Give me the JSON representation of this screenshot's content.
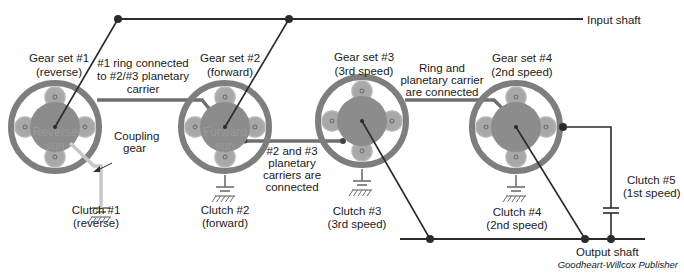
{
  "colors": {
    "ring": "#7e7e7e",
    "ring_inner": "#ffffff",
    "sun": "#8c8c8c",
    "carrier": "#bdbdbd",
    "planet": "#a8a8a8",
    "shaft": "#2b2b2b",
    "shaft_gray": "#6f6f6f",
    "coupling": "#c8c8c8"
  },
  "shafts": {
    "input": "Input shaft",
    "output": "Output shaft"
  },
  "gear_sets": [
    {
      "id": 1,
      "title": "Gear set #1",
      "subtitle": "(reverse)",
      "sun_line1": "Reverse",
      "sun_line2": "sun"
    },
    {
      "id": 2,
      "title": "Gear set #2",
      "subtitle": "(forward)",
      "sun_line1": "Forward",
      "sun_line2": "sun"
    },
    {
      "id": 3,
      "title": "Gear set #3",
      "subtitle": "(3rd speed)",
      "sun_line1": "",
      "sun_line2": ""
    },
    {
      "id": 4,
      "title": "Gear set #4",
      "subtitle": "(2nd speed)",
      "sun_line1": "",
      "sun_line2": ""
    }
  ],
  "clutches": [
    {
      "title": "Clutch #1",
      "subtitle": "(reverse)"
    },
    {
      "title": "Clutch #2",
      "subtitle": "(forward)"
    },
    {
      "title": "Clutch #3",
      "subtitle": "(3rd speed)"
    },
    {
      "title": "Clutch #4",
      "subtitle": "(2nd speed)"
    },
    {
      "title": "Clutch #5",
      "subtitle": "(1st speed)"
    }
  ],
  "annotations": {
    "ring_to_carrier": [
      "#1 ring connected",
      "to #2/#3 planetary",
      "carrier"
    ],
    "carriers_connected": [
      "#2 and #3",
      "planetary",
      "carriers are",
      "connected"
    ],
    "ring_and_carrier": [
      "Ring and",
      "planetary carrier",
      "are connected"
    ],
    "coupling": [
      "Coupling",
      "gear"
    ]
  },
  "credit": "Goodheart-Willcox Publisher"
}
